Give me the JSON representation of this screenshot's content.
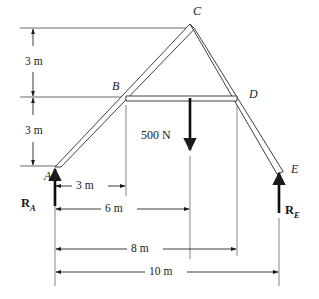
{
  "figure": {
    "type": "statics-free-body-diagram",
    "stroke_color": "#1a1a1a",
    "background_color": "#ffffff"
  },
  "nodes": [
    {
      "id": "A",
      "label": "A",
      "x": 55,
      "y": 167,
      "label_x": 44,
      "label_y": 174
    },
    {
      "id": "B",
      "label": "B",
      "x": 126,
      "y": 98,
      "label_x": 112,
      "label_y": 82
    },
    {
      "id": "C",
      "label": "C",
      "x": 190,
      "y": 30,
      "label_x": 194,
      "label_y": 6
    },
    {
      "id": "D",
      "label": "D",
      "x": 237,
      "y": 98,
      "label_x": 249,
      "label_y": 89
    },
    {
      "id": "E",
      "label": "E",
      "x": 279,
      "y": 170,
      "label_x": 291,
      "label_y": 164
    }
  ],
  "members": [
    {
      "name": "member-A-C",
      "from": "A",
      "to": "C"
    },
    {
      "name": "member-C-E",
      "from": "C",
      "to": "E"
    },
    {
      "name": "member-B-D",
      "from": "B",
      "to": "D"
    }
  ],
  "load": {
    "name": "applied-load",
    "label": "500 N",
    "magnitude": 500,
    "unit": "N",
    "direction": "down",
    "apply_x": 190,
    "apply_y": 98,
    "tip_y": 150,
    "label_x": 142,
    "label_y": 130
  },
  "reactions": [
    {
      "name": "reaction-A",
      "label": "R",
      "subscript": "A",
      "at_node": "A",
      "direction": "up",
      "x": 55,
      "tail_y": 206,
      "tip_y": 169,
      "label_x": 21,
      "label_y": 205
    },
    {
      "name": "reaction-E",
      "label": "R",
      "subscript": "E",
      "at_node": "E",
      "direction": "up",
      "x": 279,
      "tail_y": 213,
      "tip_y": 173,
      "label_x": 286,
      "label_y": 212
    }
  ],
  "vertical_dimensions": [
    {
      "name": "vertical-dim-upper-3m",
      "label": "3 m",
      "value": 3,
      "unit": "m",
      "x": 33,
      "from_y": 28,
      "to_y": 97,
      "label_x": 26,
      "label_y": 57
    },
    {
      "name": "vertical-dim-lower-3m",
      "label": "3 m",
      "value": 3,
      "unit": "m",
      "x": 33,
      "from_y": 97,
      "to_y": 166,
      "label_x": 26,
      "label_y": 125
    }
  ],
  "horizontal_dimensions": [
    {
      "name": "horizontal-dim-3m",
      "label": "3 m",
      "value": 3,
      "unit": "m",
      "y": 186,
      "from_x": 55,
      "to_x": 126,
      "label_x": 78,
      "label_y": 180
    },
    {
      "name": "horizontal-dim-6m",
      "label": "6 m",
      "value": 6,
      "unit": "m",
      "y": 209,
      "from_x": 55,
      "to_x": 190,
      "label_x": 108,
      "label_y": 203
    },
    {
      "name": "horizontal-dim-8m",
      "label": "8 m",
      "value": 8,
      "unit": "m",
      "y": 249,
      "from_x": 55,
      "to_x": 237,
      "label_x": 134,
      "label_y": 243
    },
    {
      "name": "horizontal-dim-10m",
      "label": "10 m",
      "value": 10,
      "unit": "m",
      "y": 272,
      "from_x": 55,
      "to_x": 279,
      "label_x": 152,
      "label_y": 266
    }
  ],
  "reference_lines": [
    {
      "name": "ref-line-top",
      "y": 28,
      "from_x": 20,
      "to_x": 186
    },
    {
      "name": "ref-line-middle",
      "y": 97,
      "from_x": 20,
      "to_x": 128
    },
    {
      "name": "ref-line-bottom",
      "y": 166,
      "from_x": 20,
      "to_x": 58
    }
  ],
  "extension_lines": [
    {
      "name": "ext-line-A",
      "x": 55,
      "from_y": 180,
      "to_y": 286
    },
    {
      "name": "ext-line-B",
      "x": 126,
      "from_y": 105,
      "to_y": 196
    },
    {
      "name": "ext-line-load",
      "x": 190,
      "from_y": 156,
      "to_y": 259
    },
    {
      "name": "ext-line-D",
      "x": 237,
      "from_y": 105,
      "to_y": 256
    },
    {
      "name": "ext-line-E",
      "x": 279,
      "from_y": 218,
      "to_y": 286
    }
  ]
}
